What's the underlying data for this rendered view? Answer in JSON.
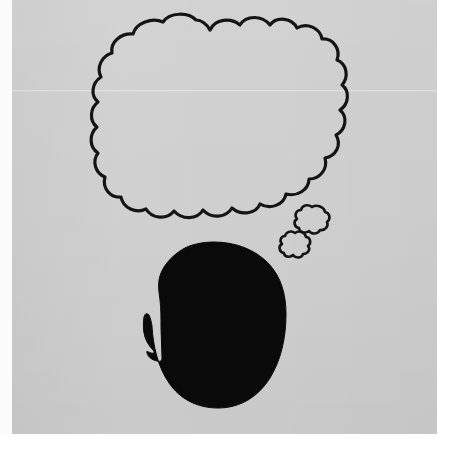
{
  "artwork": {
    "title": "Thought bubble over head silhouette",
    "medium": "ink drawing on gray paper, photographed",
    "background_color": "#cfcfcf",
    "ink_color": "#111111",
    "paper_border_color": "#ffffff",
    "caption": ""
  },
  "elements": {
    "thought_bubble": {
      "label": "Thought bubble",
      "text": "",
      "fill": "none",
      "stroke": "#141414",
      "stroke_width": 3,
      "bounds": {
        "x": 105,
        "y": 18,
        "width": 243,
        "height": 198
      },
      "lobes": 22
    },
    "bubble_trail": [
      {
        "label": "Trail bubble large",
        "stroke": "#141414",
        "stroke_width": 2.5,
        "bounds": {
          "x": 297,
          "y": 207,
          "width": 32,
          "height": 27
        }
      },
      {
        "label": "Trail bubble small",
        "stroke": "#141414",
        "stroke_width": 2.5,
        "bounds": {
          "x": 282,
          "y": 233,
          "width": 28,
          "height": 24
        }
      }
    ],
    "head_silhouette": {
      "label": "Head silhouette in profile facing left",
      "fill": "#0a0a0a",
      "facing": "left",
      "bounds": {
        "x": 146,
        "y": 242,
        "width": 140,
        "height": 166
      },
      "features": [
        "forehead",
        "brow",
        "nose",
        "upper lip",
        "chin",
        "jaw",
        "cranium"
      ]
    }
  }
}
